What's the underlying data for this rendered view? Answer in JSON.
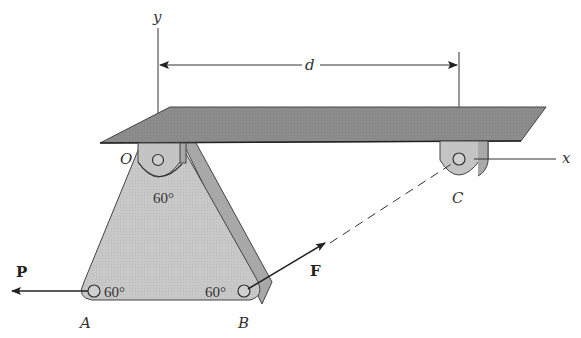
{
  "figure": {
    "axes": {
      "y_label": "y",
      "x_label": "x"
    },
    "dimension": {
      "label": "d"
    },
    "points": {
      "O": "O",
      "A": "A",
      "B": "B",
      "C": "C"
    },
    "angles": {
      "at_O": "60°",
      "at_A": "60°",
      "at_B": "60°"
    },
    "forces": {
      "P": "P",
      "F": "F"
    },
    "colors": {
      "slab": "#8c8c8c",
      "plate": "#c8c8c8",
      "plate_edge": "#a8a8a8",
      "line": "#333333"
    }
  }
}
